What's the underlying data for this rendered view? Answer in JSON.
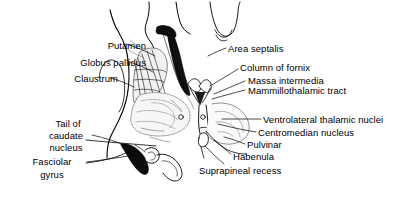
{
  "figure": {
    "background_color": "#ffffff",
    "line_color": "#000000",
    "fill_dark": "#111111",
    "fill_light": "#e9e9e9",
    "width": 415,
    "height": 205
  },
  "labels": {
    "putamen": "Putamen",
    "globus_pallidus": "Globus pallidus",
    "claustrum": "Claustrum",
    "tail_of": "Tail of",
    "caudate": "caudate",
    "nucleus": "nucleus",
    "fasciolar": "Fasciolar",
    "gyrus": "gyrus",
    "area_septalis": "Area septalis",
    "column_of_fornix": "Column of fornix",
    "massa_intermedia": "Massa intermedia",
    "mammillothalamic_tract": "Mammillothalamic tract",
    "ventrolateral_thalamic_nuclei": "Ventrolateral thalamic nuclei",
    "centromedian_nucleus": "Centromedian nucleus",
    "pulvinar": "Pulvinar",
    "habenula": "Habenula",
    "suprapineal_recess": "Suprapineal recess"
  }
}
